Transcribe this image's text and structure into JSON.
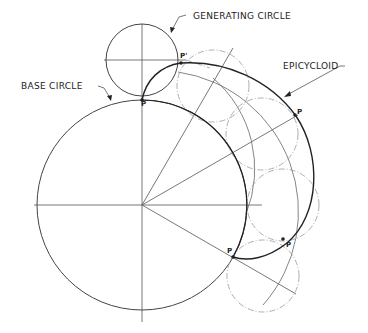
{
  "diagram": {
    "type": "geometric-construction",
    "labels": {
      "generating_circle": "GENERATING CIRCLE",
      "base_circle": "BASE CIRCLE",
      "epicycloid": "EPICYCLOID"
    },
    "points": {
      "p_start": "P",
      "p_prime": "P'",
      "p_right": "P",
      "p_lower_right": "P",
      "p_lower": "P"
    },
    "colors": {
      "ink": "#222222",
      "construction": "#999999",
      "background": "#ffffff"
    }
  }
}
